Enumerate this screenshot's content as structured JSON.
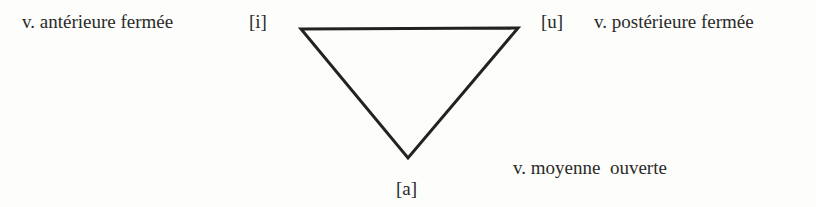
{
  "diagram": {
    "type": "vowel-triangle",
    "vertices": {
      "front_close": {
        "symbol": "[i]",
        "label": "v. antérieure fermée"
      },
      "back_close": {
        "symbol": "[u]",
        "label": "v. postérieure fermée"
      },
      "central_open": {
        "symbol": "[a]",
        "label": "v. moyenne  ouverte"
      }
    }
  }
}
